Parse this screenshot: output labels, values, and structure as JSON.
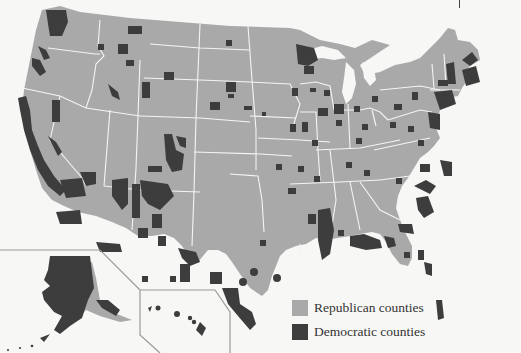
{
  "map": {
    "title": "",
    "region": "United States (counties)",
    "insets": [
      "Alaska",
      "Hawaii"
    ],
    "colors": {
      "republican": "#a9a9a9",
      "democratic": "#3d3d3d",
      "background": "#f7f7f5"
    }
  },
  "legend": {
    "items": [
      {
        "label": "Republican counties",
        "color": "#a9a9a9"
      },
      {
        "label": "Democratic counties",
        "color": "#3d3d3d"
      }
    ]
  }
}
